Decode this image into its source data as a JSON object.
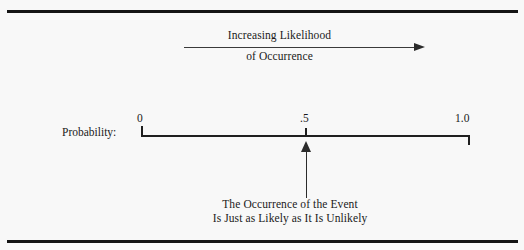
{
  "figure": {
    "background_color": "#f8f8f8",
    "rule_color": "#141414",
    "line_color": "#1f1f1f"
  },
  "top_annotation": {
    "line1": "Increasing Likelihood",
    "line2": "of Occurrence",
    "arrow_direction": "right",
    "arrow_icon": "arrow-right-icon"
  },
  "scale": {
    "axis_label": "Probability:",
    "ticks": [
      {
        "value": "0",
        "position": 0.0
      },
      {
        "value": ".5",
        "position": 0.5
      },
      {
        "value": "1.0",
        "position": 1.0
      }
    ],
    "tick_zero": "0",
    "tick_half": ".5",
    "tick_one": "1.0"
  },
  "callout": {
    "arrow_icon": "arrow-up-icon",
    "points_to": ".5",
    "line1": "The Occurrence of the Event",
    "line2": "Is Just as Likely as It Is Unlikely"
  }
}
